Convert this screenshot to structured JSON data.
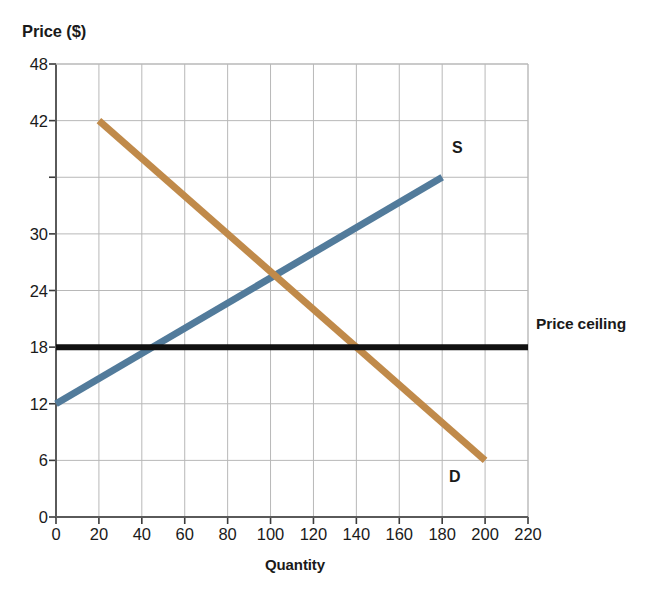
{
  "chart_data": {
    "type": "line",
    "title": "",
    "xlabel": "Quantity",
    "ylabel": "Price ($)",
    "xlim": [
      0,
      220
    ],
    "ylim": [
      0,
      48
    ],
    "grid": true,
    "legend_position": "inline-annotations",
    "x_ticks": [
      0,
      20,
      40,
      60,
      80,
      100,
      120,
      140,
      160,
      180,
      200,
      220
    ],
    "x_tick_labels": [
      "0",
      "20",
      "40",
      "60",
      "80",
      "100",
      "120",
      "140",
      "160",
      "180",
      "200",
      "220"
    ],
    "y_ticks": [
      0,
      6,
      12,
      18,
      24,
      30,
      36,
      42,
      48
    ],
    "y_tick_labels": [
      "0",
      "6",
      "12",
      "18",
      "24",
      "",
      "30",
      "42",
      "48"
    ],
    "y_axis_labeled_ticks": [
      {
        "value": 48,
        "label": "48"
      },
      {
        "value": 42,
        "label": "42"
      },
      {
        "value": 36,
        "label": ""
      },
      {
        "value": 30,
        "label": "30"
      },
      {
        "value": 24,
        "label": "24"
      },
      {
        "value": 18,
        "label": "18"
      },
      {
        "value": 12,
        "label": "12"
      },
      {
        "value": 6,
        "label": "6"
      },
      {
        "value": 0,
        "label": "0"
      }
    ],
    "series": [
      {
        "name": "S",
        "label": "S",
        "description": "Supply curve",
        "color": "#527b9b",
        "linewidth": 7,
        "points": [
          [
            0,
            12
          ],
          [
            180,
            36
          ]
        ]
      },
      {
        "name": "D",
        "label": "D",
        "description": "Demand curve",
        "color": "#c08a4a",
        "linewidth": 7,
        "points": [
          [
            20,
            42
          ],
          [
            200,
            6
          ]
        ]
      },
      {
        "name": "Price ceiling",
        "label": "Price ceiling",
        "description": "Horizontal price ceiling line",
        "color": "#111111",
        "linewidth": 6,
        "points": [
          [
            0,
            18
          ],
          [
            220,
            18
          ]
        ]
      }
    ],
    "annotations": [
      {
        "text": "S",
        "x": 184,
        "y": 38
      },
      {
        "text": "D",
        "x": 186,
        "y": 8
      },
      {
        "text": "Price ceiling",
        "x": 224,
        "y": 18
      }
    ],
    "equilibrium": {
      "quantity": 96,
      "price": 23.2
    },
    "price_ceiling_value": 18
  },
  "axes": {
    "y_title": "Price ($)",
    "x_title": "Quantity"
  },
  "colors": {
    "supply": "#527b9b",
    "demand": "#c08a4a",
    "price_ceiling": "#111111",
    "grid": "#b8b8b8",
    "axis": "#555555",
    "text": "#1a1a1a",
    "background": "#ffffff"
  }
}
